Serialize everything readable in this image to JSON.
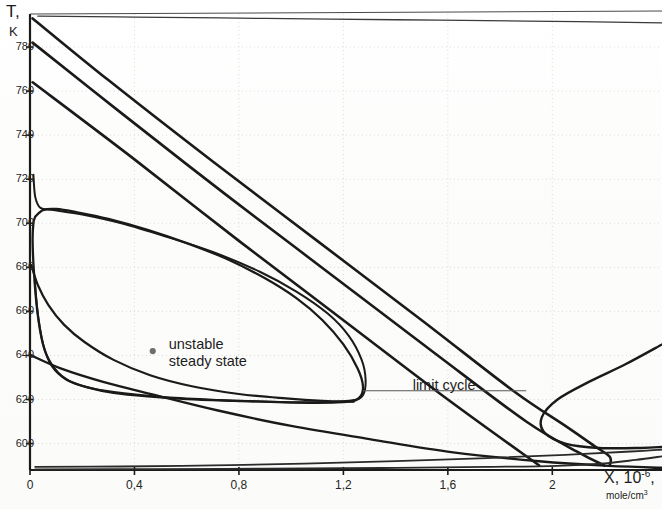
{
  "chart_data": {
    "type": "line",
    "title": "",
    "subtitle": "",
    "xlabel": "X, 10-6, mole/cm3",
    "xlabel_main": "X, 10",
    "xlabel_exp": "-6",
    "xlabel_unit": "mole/cm",
    "xlabel_unit_exp": "3",
    "ylabel": "T, K",
    "ylabel_main": "T,",
    "ylabel_unit": "K",
    "xlim": [
      0,
      2.42
    ],
    "ylim": [
      588,
      795
    ],
    "grid": "dotted-faint",
    "legend": "none",
    "xticks": [
      0,
      0.4,
      0.8,
      1.2,
      1.6,
      2
    ],
    "xticklabels": [
      "0",
      "0,4",
      "0,8",
      "1,2",
      "1,6",
      "2"
    ],
    "yticks": [
      600,
      620,
      640,
      660,
      680,
      700,
      720,
      740,
      760,
      780
    ],
    "yticklabels": [
      "600",
      "620",
      "640",
      "660",
      "680",
      "700",
      "720",
      "740",
      "760",
      "780"
    ],
    "annotations": [
      {
        "name": "unstable-steady-state",
        "line1": "unstable",
        "line2": "steady state",
        "x": 0.47,
        "y": 642,
        "marker": "dot",
        "marker_color": "#6e6e6e"
      },
      {
        "name": "limit-cycle",
        "text": "limit cycle",
        "x": 1.45,
        "y": 623,
        "leader": true
      }
    ],
    "series": [
      {
        "name": "limit-cycle-orbit",
        "role": "closed-orbit",
        "color": "#1a1a1a",
        "width": 2.3,
        "points": [
          [
            0.02,
            703
          ],
          [
            0.05,
            706
          ],
          [
            0.1,
            706.5
          ],
          [
            0.18,
            705
          ],
          [
            0.3,
            702
          ],
          [
            0.45,
            697
          ],
          [
            0.6,
            691
          ],
          [
            0.75,
            684
          ],
          [
            0.9,
            675
          ],
          [
            1.02,
            666
          ],
          [
            1.12,
            656
          ],
          [
            1.2,
            645
          ],
          [
            1.255,
            634
          ],
          [
            1.275,
            626
          ],
          [
            1.262,
            621
          ],
          [
            1.22,
            619
          ],
          [
            1.1,
            618.5
          ],
          [
            0.95,
            618.8
          ],
          [
            0.78,
            619.4
          ],
          [
            0.6,
            620.2
          ],
          [
            0.45,
            621.4
          ],
          [
            0.32,
            623
          ],
          [
            0.22,
            625.5
          ],
          [
            0.14,
            629
          ],
          [
            0.085,
            635
          ],
          [
            0.05,
            645
          ],
          [
            0.028,
            660
          ],
          [
            0.015,
            678
          ],
          [
            0.01,
            692
          ],
          [
            0.013,
            700
          ],
          [
            0.02,
            703
          ]
        ]
      },
      {
        "name": "trajectory-outer-top",
        "role": "incoming",
        "color": "#1a1a1a",
        "width": 2.6,
        "points": [
          [
            0.01,
            793
          ],
          [
            0.3,
            765
          ],
          [
            0.7,
            728
          ],
          [
            1.1,
            692
          ],
          [
            1.5,
            656
          ],
          [
            1.85,
            624
          ],
          [
            2.05,
            608
          ],
          [
            2.16,
            599
          ],
          [
            2.22,
            594
          ],
          [
            2.22,
            590
          ]
        ]
      },
      {
        "name": "trajectory-second",
        "role": "incoming",
        "color": "#1a1a1a",
        "width": 2.6,
        "points": [
          [
            0.01,
            782
          ],
          [
            0.35,
            750
          ],
          [
            0.75,
            713
          ],
          [
            1.15,
            677
          ],
          [
            1.55,
            641
          ],
          [
            1.9,
            610
          ],
          [
            2.1,
            596
          ],
          [
            2.2,
            590
          ]
        ]
      },
      {
        "name": "trajectory-third",
        "role": "incoming",
        "color": "#1a1a1a",
        "width": 2.6,
        "points": [
          [
            0.01,
            764
          ],
          [
            0.4,
            729
          ],
          [
            0.8,
            692
          ],
          [
            1.2,
            656
          ],
          [
            1.6,
            620
          ],
          [
            1.95,
            590
          ]
        ]
      },
      {
        "name": "trajectory-spiral-in-upper",
        "role": "inward",
        "color": "#1a1a1a",
        "width": 2.0,
        "points": [
          [
            0.013,
            722
          ],
          [
            0.02,
            712
          ],
          [
            0.04,
            707
          ],
          [
            0.09,
            706
          ],
          [
            0.2,
            704
          ],
          [
            0.35,
            700
          ],
          [
            0.52,
            694
          ],
          [
            0.7,
            687
          ],
          [
            0.88,
            678
          ],
          [
            1.02,
            669
          ],
          [
            1.14,
            659
          ],
          [
            1.22,
            649
          ],
          [
            1.27,
            638
          ],
          [
            1.285,
            629
          ],
          [
            1.275,
            622
          ],
          [
            1.23,
            619.5
          ],
          [
            1.1,
            618.8
          ],
          [
            0.92,
            619
          ],
          [
            0.72,
            619.8
          ],
          [
            0.52,
            621
          ],
          [
            0.36,
            622.8
          ],
          [
            0.24,
            625
          ],
          [
            0.15,
            628.5
          ],
          [
            0.095,
            634
          ],
          [
            0.055,
            643
          ],
          [
            0.032,
            657
          ],
          [
            0.018,
            674
          ]
        ]
      },
      {
        "name": "trajectory-from-680",
        "role": "inward",
        "color": "#1a1a1a",
        "width": 2.2,
        "points": [
          [
            0.005,
            681
          ],
          [
            0.03,
            672
          ],
          [
            0.07,
            663
          ],
          [
            0.13,
            654
          ],
          [
            0.21,
            646
          ],
          [
            0.32,
            638
          ],
          [
            0.46,
            631
          ],
          [
            0.62,
            626
          ],
          [
            0.8,
            622.5
          ],
          [
            0.98,
            620.5
          ],
          [
            1.12,
            619.4
          ],
          [
            1.24,
            619
          ]
        ]
      },
      {
        "name": "trajectory-from-640",
        "role": "lower",
        "color": "#1a1a1a",
        "width": 2.4,
        "points": [
          [
            0.005,
            640
          ],
          [
            0.12,
            634
          ],
          [
            0.28,
            628
          ],
          [
            0.48,
            622
          ],
          [
            0.72,
            615
          ],
          [
            1.0,
            608
          ],
          [
            1.3,
            602
          ],
          [
            1.62,
            596
          ],
          [
            1.95,
            592
          ],
          [
            2.2,
            590
          ],
          [
            2.42,
            589
          ]
        ]
      },
      {
        "name": "trajectory-near-axis-upper",
        "role": "lower",
        "color": "#2a2a2a",
        "width": 1.8,
        "points": [
          [
            0.02,
            589.4
          ],
          [
            0.35,
            589.6
          ],
          [
            0.7,
            590.1
          ],
          [
            1.05,
            590.9
          ],
          [
            1.4,
            592.0
          ],
          [
            1.75,
            593.4
          ],
          [
            2.05,
            594.9
          ],
          [
            2.3,
            596.4
          ],
          [
            2.42,
            597.3
          ]
        ]
      },
      {
        "name": "trajectory-near-axis-lower",
        "role": "lower",
        "color": "#2a2a2a",
        "width": 1.8,
        "points": [
          [
            0.02,
            588.3
          ],
          [
            0.45,
            588.4
          ],
          [
            0.9,
            588.6
          ],
          [
            1.35,
            588.9
          ],
          [
            1.75,
            589.4
          ],
          [
            2.02,
            589.9
          ],
          [
            2.2,
            591.0
          ],
          [
            2.32,
            592.6
          ],
          [
            2.42,
            594.2
          ]
        ]
      },
      {
        "name": "trajectory-return-top",
        "role": "return",
        "color": "#3a3a3a",
        "width": 1.3,
        "points": [
          [
            0.03,
            794
          ],
          [
            0.4,
            793.6
          ],
          [
            0.9,
            793.0
          ],
          [
            1.4,
            792.4
          ],
          [
            1.9,
            791.8
          ],
          [
            2.42,
            791.0
          ]
        ]
      },
      {
        "name": "trajectory-right-turn",
        "role": "turnaround",
        "color": "#1a1a1a",
        "width": 2.4,
        "points": [
          [
            2.42,
            645
          ],
          [
            2.28,
            636
          ],
          [
            2.14,
            628
          ],
          [
            2.02,
            620
          ],
          [
            1.96,
            612
          ],
          [
            1.97,
            605
          ],
          [
            2.05,
            600
          ],
          [
            2.18,
            598
          ],
          [
            2.34,
            598
          ],
          [
            2.42,
            598.5
          ]
        ]
      }
    ]
  },
  "figure": {
    "axis_color": "#1a1a1a",
    "grid_color": "#d8d8d4",
    "background": "#fdfdfc",
    "frame_top": true,
    "frame_left": true,
    "frame_bottom": true,
    "frame_right": false
  }
}
